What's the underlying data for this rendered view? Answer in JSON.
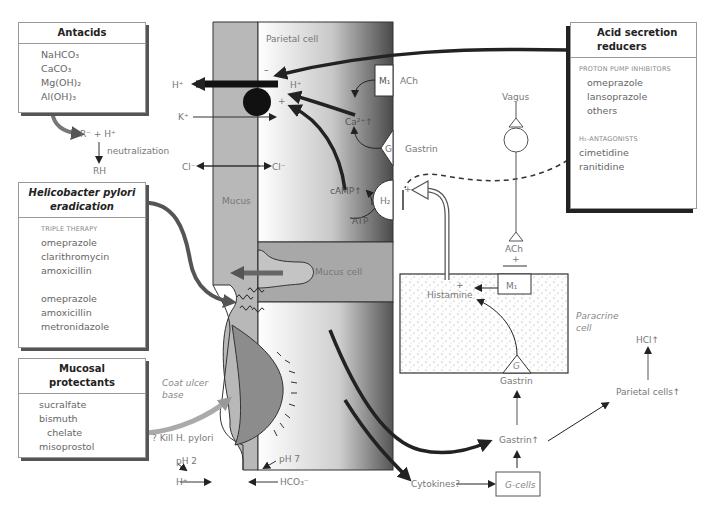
{
  "boxes": {
    "antacids": {
      "title": "Antacids",
      "items": [
        "NaHCO₃",
        "CaCO₃",
        "Mg(OH)₂",
        "Al(OH)₃"
      ]
    },
    "hpylori": {
      "title_line1": "Helicobacter pylori",
      "title_line2": "eradication",
      "subhead": "TRIPLE THERAPY",
      "regimen1": [
        "omeprazole",
        "clarithromycin",
        "amoxicillin"
      ],
      "regimen2": [
        "omeprazole",
        "amoxicillin",
        "metronidazole"
      ]
    },
    "mucosal": {
      "title_line1": "Mucosal",
      "title_line2": "protectants",
      "items": [
        "sucralfate",
        "bismuth",
        "chelate",
        "misoprostol"
      ]
    },
    "acid_reducers": {
      "title_line1": "Acid secretion",
      "title_line2": "reducers",
      "ppi_subhead": "PROTON PUMP INHIBITORS",
      "ppi_items": [
        "omeprazole",
        "lansoprazole",
        "others"
      ],
      "h2_subhead": "H₂-ANTAGONISTS",
      "h2_items": [
        "cimetidine",
        "ranitidine"
      ]
    }
  },
  "labels": {
    "neutralization_reactants": "R⁻ + H⁺",
    "neutralization": "neutralization",
    "neutralization_product": "RH",
    "h_plus_left": "H⁺",
    "k_plus": "K⁺",
    "cl_left": "Cl⁻",
    "cl_right": "Cl⁻",
    "parietal_cell": "Parietal cell",
    "minus_sign": "–",
    "plus_sign": "+",
    "h_plus_cell": "H⁺",
    "m1": "M₁",
    "ach": "ACh",
    "ca": "Ca²⁺↑",
    "g": "G",
    "gastrin": "Gastrin",
    "camp": "cAMP↑",
    "atp": "ATP",
    "h2": "H₂",
    "mucus": "Mucus",
    "mucus_cell": "Mucus cell",
    "vagus": "Vagus",
    "ach_bottom": "ACh",
    "histamine": "Histamine",
    "m1_paracrine": "M₁",
    "paracrine_line1": "Paracrine",
    "paracrine_line2": "cell",
    "g_paracrine": "G",
    "gastrin_paracrine": "Gastrin",
    "hcl": "HCl↑",
    "parietal_cells": "Parietal cells↑",
    "gastrin_up": "Gastrin↑",
    "g_cells": "G-cells",
    "cytokines": "Cytokines?",
    "coat_line1": "Coat ulcer",
    "coat_line2": "base",
    "kill_hpylori": "? Kill H. pylori",
    "ph2": "pH 2",
    "ph7": "pH 7",
    "h_plus_bottom": "H⁺",
    "hco3": "HCO₃⁻"
  },
  "colors": {
    "mucus_layer": "#b5b5b5",
    "ulcer": "#8c8c8c",
    "cell_dark": "#5a5a5a",
    "arrow_dark": "#222222",
    "arrow_grey": "#888888"
  }
}
